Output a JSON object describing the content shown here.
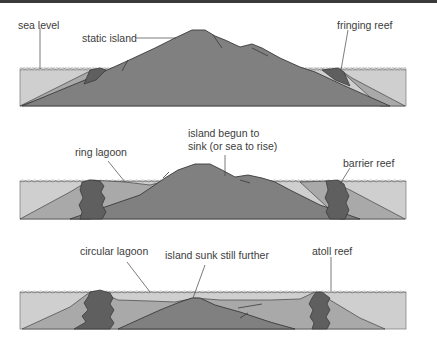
{
  "diagram": {
    "title": "",
    "panels": [
      {
        "stage": "static island",
        "labels": {
          "sea_level": "sea level",
          "island": "static island",
          "reef": "fringing reef"
        }
      },
      {
        "stage": "island sinking",
        "labels": {
          "lagoon": "ring lagoon",
          "island_line1": "island begun to",
          "island_line2": "sink (or sea to rise)",
          "reef": "barrier reef"
        }
      },
      {
        "stage": "atoll",
        "labels": {
          "lagoon": "circular lagoon",
          "island": "island sunk still further",
          "reef": "atoll reef"
        }
      }
    ],
    "colors": {
      "water": "#c9c9c9",
      "island": "#7e7e7e",
      "reef": "#5f5f5f",
      "sediment": "#a9a9a9",
      "outline": "#3a3a3a",
      "text": "#3c3c3c"
    }
  }
}
